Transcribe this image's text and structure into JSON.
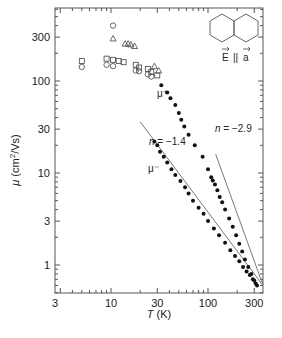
{
  "chart_data": {
    "type": "scatter",
    "title": "",
    "xlabel": "T (K)",
    "ylabel": "μ (cm²/Vs)",
    "xscale": "log",
    "yscale": "log",
    "xlim": [
      3,
      370
    ],
    "ylim": [
      0.5,
      620
    ],
    "x_ticks": [
      3,
      10,
      30,
      100,
      300
    ],
    "y_ticks": [
      1,
      3,
      10,
      30,
      100,
      300
    ],
    "grid": false,
    "legend": null,
    "inset": {
      "molecule": "naphthalene",
      "label": "E || a"
    },
    "annotations": [
      {
        "text": "μ⁺",
        "x": 42,
        "y": 60
      },
      {
        "text": "μ⁻",
        "x": 33,
        "y": 9
      },
      {
        "text": "n = −1.4",
        "x": 45,
        "y": 24
      },
      {
        "text": "n = −2.9",
        "x": 150,
        "y": 24
      }
    ],
    "series": [
      {
        "name": "open squares",
        "marker": "square",
        "filled": false,
        "x": [
          5,
          9,
          10.5,
          12,
          13.5,
          18,
          19.5,
          24,
          26,
          30
        ],
        "y": [
          165,
          175,
          170,
          165,
          160,
          150,
          140,
          135,
          125,
          115
        ]
      },
      {
        "name": "open circles",
        "marker": "circle",
        "filled": false,
        "x": [
          5,
          9,
          10.5,
          18,
          19.5,
          24,
          26
        ],
        "y": [
          142,
          150,
          145,
          130,
          128,
          118,
          112
        ]
      },
      {
        "name": "open circle (high)",
        "marker": "circle",
        "filled": false,
        "x": [
          10.5
        ],
        "y": [
          400
        ]
      },
      {
        "name": "open triangles",
        "marker": "triangle",
        "filled": false,
        "x": [
          10.5,
          14,
          15,
          16,
          17.5,
          28,
          31
        ],
        "y": [
          290,
          255,
          255,
          250,
          240,
          145,
          130
        ]
      },
      {
        "name": "μ+",
        "marker": "circle",
        "filled": true,
        "x": [
          33,
          38,
          41,
          46,
          50,
          53,
          57,
          63,
          73,
          88,
          100,
          108,
          112,
          118,
          125,
          132,
          140,
          150,
          165,
          180,
          195,
          210,
          225,
          240,
          260,
          280,
          300,
          320
        ],
        "y": [
          90,
          75,
          65,
          55,
          45,
          38,
          32,
          26,
          20,
          15,
          11,
          9,
          8.3,
          7.5,
          6.5,
          5.5,
          4.8,
          4.0,
          3.2,
          2.6,
          2.1,
          1.7,
          1.4,
          1.15,
          0.95,
          0.8,
          0.68,
          0.6
        ]
      },
      {
        "name": "μ−",
        "marker": "circle",
        "filled": true,
        "x": [
          28,
          30,
          32,
          35,
          38,
          42,
          46,
          52,
          58,
          63,
          70,
          80,
          90,
          100,
          115,
          130,
          150,
          170,
          190,
          210,
          230,
          250,
          270,
          290,
          310
        ],
        "y": [
          22,
          20,
          17,
          15,
          13,
          11,
          9.5,
          8.2,
          7.0,
          6.0,
          5.0,
          4.2,
          3.6,
          3.0,
          2.5,
          2.1,
          1.75,
          1.45,
          1.25,
          1.1,
          0.95,
          0.85,
          0.78,
          0.7,
          0.63
        ]
      }
    ],
    "fit_lines": [
      {
        "name": "n = −1.4",
        "exponent": -1.4,
        "x": [
          20,
          360
        ],
        "y": [
          36,
          0.62
        ]
      },
      {
        "name": "n = −2.9",
        "exponent": -2.9,
        "x": [
          120,
          360
        ],
        "y": [
          16,
          0.65
        ]
      }
    ]
  }
}
